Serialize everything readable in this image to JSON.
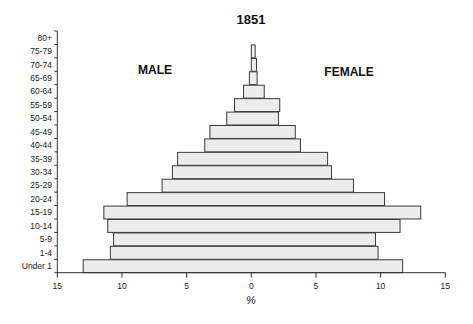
{
  "chart_data": {
    "type": "bar",
    "orientation": "horizontal",
    "subtype": "population-pyramid",
    "title": "1851",
    "xlabel": "%",
    "ylabel": "",
    "xlim": [
      -15,
      15
    ],
    "xticks": [
      -15,
      -10,
      -5,
      0,
      5,
      10,
      15
    ],
    "xtick_labels": [
      "15",
      "10",
      "5",
      "0",
      "5",
      "10",
      "15"
    ],
    "categories": [
      "80+",
      "75-79",
      "70-74",
      "65-69",
      "60-64",
      "55-59",
      "50-54",
      "45-49",
      "40-44",
      "35-39",
      "30-34",
      "25-29",
      "20-24",
      "15-19",
      "10-14",
      "5-9",
      "1-4",
      "Under 1"
    ],
    "side_labels": {
      "left": "MALE",
      "right": "FEMALE"
    },
    "grid": false,
    "legend": "none",
    "series": [
      {
        "name": "MALE",
        "side": "left",
        "values": [
          0,
          0.0,
          0.0,
          0.15,
          0.6,
          1.3,
          1.9,
          3.2,
          3.6,
          5.7,
          6.1,
          6.9,
          9.6,
          11.4,
          11.1,
          10.65,
          10.9,
          13.0
        ]
      },
      {
        "name": "FEMALE",
        "side": "right",
        "values": [
          0,
          0.3,
          0.4,
          0.45,
          1.0,
          2.2,
          2.1,
          3.4,
          3.8,
          5.9,
          6.2,
          7.9,
          10.3,
          13.1,
          11.5,
          9.6,
          9.8,
          11.7
        ]
      }
    ]
  }
}
